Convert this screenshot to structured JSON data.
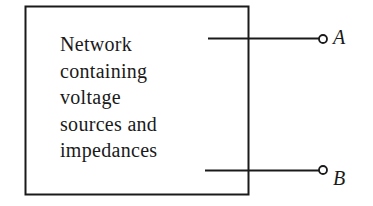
{
  "diagram": {
    "type": "network-two-terminal",
    "box": {
      "label_lines": [
        "Network",
        "containing",
        "voltage",
        "sources and",
        "impedances"
      ]
    },
    "terminals": [
      {
        "id": "A",
        "label": "A"
      },
      {
        "id": "B",
        "label": "B"
      }
    ],
    "colors": {
      "stroke": "#1a1a1a",
      "background": "#ffffff"
    }
  }
}
